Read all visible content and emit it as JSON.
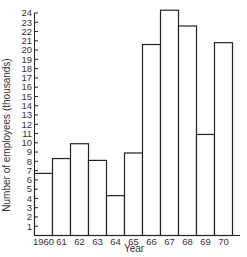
{
  "chart_data": {
    "type": "bar",
    "title": "",
    "xlabel": "Year",
    "ylabel": "Number of employees (thousands)",
    "categories": [
      "1960",
      "61",
      "62",
      "63",
      "64",
      "65",
      "66",
      "67",
      "68",
      "69",
      "70"
    ],
    "values": [
      6.7,
      8.3,
      9.9,
      8.1,
      4.3,
      8.9,
      20.6,
      24.3,
      22.6,
      10.9,
      20.8
    ],
    "ylim": [
      0,
      24
    ],
    "yticks": [
      1,
      2,
      3,
      4,
      5,
      6,
      7,
      8,
      9,
      10,
      11,
      12,
      13,
      14,
      15,
      16,
      17,
      18,
      19,
      20,
      21,
      22,
      23,
      24
    ],
    "grid": false,
    "legend": null,
    "bar_style": {
      "fill": "#ffffff",
      "stroke": "#222222"
    }
  }
}
